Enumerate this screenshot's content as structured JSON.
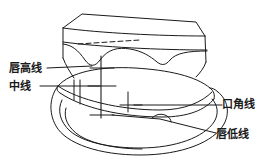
{
  "figure": {
    "stroke_color": "#1a1a1a",
    "background_color": "#ffffff",
    "width": 268,
    "height": 165
  },
  "labels": {
    "lip_high_line": "唇高线",
    "midline": "中线",
    "commissure_line": "口角线",
    "lip_low_line": "唇低线"
  },
  "markings": {
    "dashed_line": "dashed-guide-line",
    "midline_mark": "vertical-midline-scribe",
    "cross_marks": "cross-tick-marks"
  }
}
